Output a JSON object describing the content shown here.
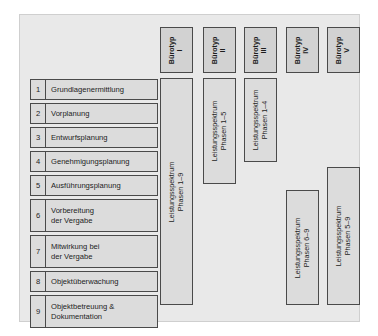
{
  "diagram": {
    "colors": {
      "panel_background": "#e9e9e9",
      "box_fill": "#dcdcdc",
      "header_box_fill": "#d2d2d2",
      "border": "#4a4a4a",
      "text": "#1d1d1d",
      "page_background": "#ffffff"
    }
  },
  "office_types": [
    {
      "name": "office-type-1",
      "line1": "Bürotyp",
      "line2": "I"
    },
    {
      "name": "office-type-2",
      "line1": "Bürotyp",
      "line2": "II"
    },
    {
      "name": "office-type-3",
      "line1": "Bürotyp",
      "line2": "III"
    },
    {
      "name": "office-type-4",
      "line1": "Bürotyp",
      "line2": "IV"
    },
    {
      "name": "office-type-5",
      "line1": "Bürotyp",
      "line2": "V"
    }
  ],
  "phases": [
    {
      "number": "1",
      "label": "Grundlagenermittlung"
    },
    {
      "number": "2",
      "label": "Vorplanung"
    },
    {
      "number": "3",
      "label": "Entwurfsplanung"
    },
    {
      "number": "4",
      "label": "Genehmigungsplanung"
    },
    {
      "number": "5",
      "label": "Ausführungsplanung"
    },
    {
      "number": "6",
      "label": "Vorbereitung\nder Vergabe"
    },
    {
      "number": "7",
      "label": "Mitwirkung bei\nder Vergabe"
    },
    {
      "number": "8",
      "label": "Objektüberwachung"
    },
    {
      "number": "9",
      "label": "Objektbetreuung &\nDokumentation"
    }
  ],
  "spectrum_bars": [
    {
      "name": "spectrum-bar-1",
      "line1": "Leistungsspektrum",
      "line2": "Phasen 1–9",
      "office_type": "I",
      "phases_from": 1,
      "phases_to": 9
    },
    {
      "name": "spectrum-bar-2",
      "line1": "Leistungsspektrum",
      "line2": "Phasen 1–5",
      "office_type": "II",
      "phases_from": 1,
      "phases_to": 5
    },
    {
      "name": "spectrum-bar-3",
      "line1": "Leistungsspektrum",
      "line2": "Phasen 1–4",
      "office_type": "III",
      "phases_from": 1,
      "phases_to": 4
    },
    {
      "name": "spectrum-bar-4",
      "line1": "Leistungsspektrum",
      "line2": "Phasen 6–9",
      "office_type": "IV",
      "phases_from": 6,
      "phases_to": 9
    },
    {
      "name": "spectrum-bar-5",
      "line1": "Leistungsspektrum",
      "line2": "Phasen 5–9",
      "office_type": "V",
      "phases_from": 5,
      "phases_to": 9
    }
  ]
}
